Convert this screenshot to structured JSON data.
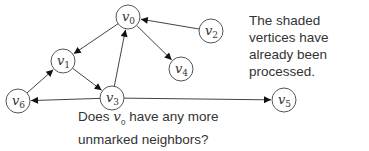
{
  "diagram": {
    "type": "directed-graph",
    "node_radius": 12,
    "colors": {
      "stroke": "#555555",
      "fill": "#ffffff",
      "text": "#333333"
    },
    "nodes": [
      {
        "id": "v0",
        "label": "v",
        "sub": "0",
        "x": 128,
        "y": 17,
        "shaded": false
      },
      {
        "id": "v1",
        "label": "v",
        "sub": "1",
        "x": 63,
        "y": 61,
        "shaded": false
      },
      {
        "id": "v2",
        "label": "v",
        "sub": "2",
        "x": 211,
        "y": 31,
        "shaded": false
      },
      {
        "id": "v3",
        "label": "v",
        "sub": "3",
        "x": 112,
        "y": 98,
        "shaded": false
      },
      {
        "id": "v4",
        "label": "v",
        "sub": "4",
        "x": 181,
        "y": 69,
        "shaded": false
      },
      {
        "id": "v5",
        "label": "v",
        "sub": "5",
        "x": 284,
        "y": 100,
        "shaded": false
      },
      {
        "id": "v6",
        "label": "v",
        "sub": "6",
        "x": 18,
        "y": 101,
        "shaded": false
      }
    ],
    "edges": [
      {
        "from": "v0",
        "to": "v1"
      },
      {
        "from": "v0",
        "to": "v4"
      },
      {
        "from": "v2",
        "to": "v0"
      },
      {
        "from": "v1",
        "to": "v3"
      },
      {
        "from": "v3",
        "to": "v0"
      },
      {
        "from": "v3",
        "to": "v6"
      },
      {
        "from": "v6",
        "to": "v1"
      },
      {
        "from": "v3",
        "to": "v5"
      }
    ]
  },
  "notes": {
    "right": "The shaded vertices have already been processed.",
    "bottom_prefix": "Does ",
    "bottom_var": "v",
    "bottom_sub": "0",
    "bottom_suffix": " have any more unmarked neighbors?"
  }
}
